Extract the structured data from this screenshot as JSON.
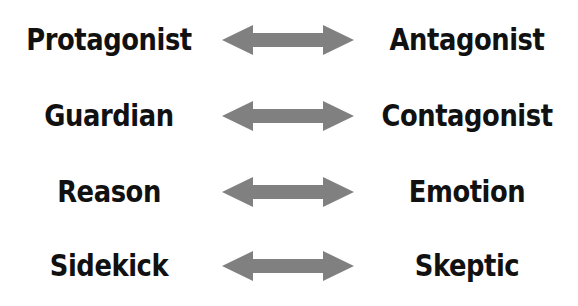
{
  "diagram": {
    "arrow_color": "#808080",
    "text_color": "#111111",
    "pairs": [
      {
        "left": "Protagonist",
        "right": "Antagonist"
      },
      {
        "left": "Guardian",
        "right": "Contagonist"
      },
      {
        "left": "Reason",
        "right": "Emotion"
      },
      {
        "left": "Sidekick",
        "right": "Skeptic"
      }
    ]
  }
}
